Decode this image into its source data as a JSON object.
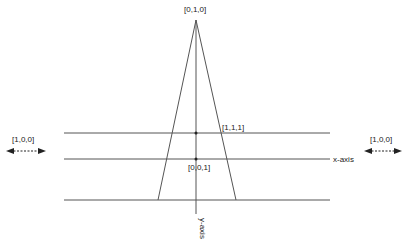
{
  "diagram": {
    "labels": {
      "top": "[0,1,0]",
      "point_111": "[1,1,1]",
      "point_001": "[0,0,1]",
      "left_dir": "[1,0,0]",
      "right_dir": "[1,0,0]",
      "x_axis": "x-axis",
      "y_axis": "y-axis"
    },
    "colors": {
      "line": "#555555",
      "text": "#222222"
    }
  }
}
